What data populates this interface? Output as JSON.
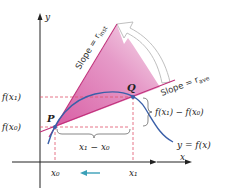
{
  "diagram": {
    "axes": {
      "x_label": "x",
      "y_label": "y"
    },
    "points": {
      "P": {
        "label": "P"
      },
      "Q": {
        "label": "Q"
      }
    },
    "y_ticks": {
      "fx1": "f(x₁)",
      "fx0": "f(x₀)"
    },
    "x_ticks": {
      "x0": "x₀",
      "x1": "x₁"
    },
    "annotations": {
      "slope_inst": "Slope = r",
      "slope_inst_sub": "inst",
      "slope_ave": "Slope = r",
      "slope_ave_sub": "ave",
      "delta_y": "f(x₁) − f(x₀)",
      "delta_x": "x₁ − x₀",
      "curve": "y = f(x)"
    },
    "colors": {
      "curve": "#3a5fa8",
      "lines": "#c0307a",
      "wedge": "#e07ab4",
      "dashed": "#e0506a",
      "arrow": "#3aa0b8"
    }
  }
}
